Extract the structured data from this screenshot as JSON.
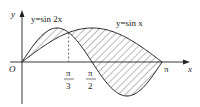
{
  "diagram": {
    "axes": {
      "x_label": "x",
      "y_label": "y",
      "origin_label": "O"
    },
    "curves": [
      {
        "name": "sin2x",
        "label": "y=sin 2x"
      },
      {
        "name": "sinx",
        "label": "y=sin x"
      }
    ],
    "ticks": [
      {
        "num": "π",
        "den": "3"
      },
      {
        "num": "π",
        "den": "2"
      },
      {
        "label": "π"
      }
    ],
    "shaded_region": "between y=sin 2x and y=sin x on [0, π]",
    "colors": {
      "stroke": "#222222",
      "hatch": "#555555",
      "dash": "#444444"
    }
  }
}
